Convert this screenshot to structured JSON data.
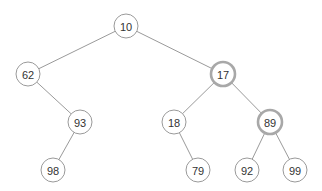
{
  "diagram": {
    "type": "binary-tree",
    "colors": {
      "background": "#ffffff",
      "node_fill": "#ffffff",
      "node_stroke": "#9a9a9a",
      "highlight_stroke": "#a8a8a8",
      "edge": "#9a9a9a",
      "text": "#333333"
    },
    "nodes": [
      {
        "id": "n10",
        "label": "10",
        "x": 126,
        "y": 26,
        "highlighted": false
      },
      {
        "id": "n62",
        "label": "62",
        "x": 28,
        "y": 74,
        "highlighted": false
      },
      {
        "id": "n17",
        "label": "17",
        "x": 223,
        "y": 74,
        "highlighted": true
      },
      {
        "id": "n93",
        "label": "93",
        "x": 80,
        "y": 122,
        "highlighted": false
      },
      {
        "id": "n18",
        "label": "18",
        "x": 174,
        "y": 122,
        "highlighted": false
      },
      {
        "id": "n89",
        "label": "89",
        "x": 270,
        "y": 122,
        "highlighted": true
      },
      {
        "id": "n98",
        "label": "98",
        "x": 53,
        "y": 170,
        "highlighted": false
      },
      {
        "id": "n79",
        "label": "79",
        "x": 198,
        "y": 170,
        "highlighted": false
      },
      {
        "id": "n92",
        "label": "92",
        "x": 247,
        "y": 170,
        "highlighted": false
      },
      {
        "id": "n99",
        "label": "99",
        "x": 295,
        "y": 170,
        "highlighted": false
      }
    ],
    "edges": [
      {
        "from": "n10",
        "to": "n62"
      },
      {
        "from": "n10",
        "to": "n17"
      },
      {
        "from": "n62",
        "to": "n93"
      },
      {
        "from": "n17",
        "to": "n18"
      },
      {
        "from": "n17",
        "to": "n89"
      },
      {
        "from": "n93",
        "to": "n98"
      },
      {
        "from": "n18",
        "to": "n79"
      },
      {
        "from": "n89",
        "to": "n92"
      },
      {
        "from": "n89",
        "to": "n99"
      }
    ]
  }
}
